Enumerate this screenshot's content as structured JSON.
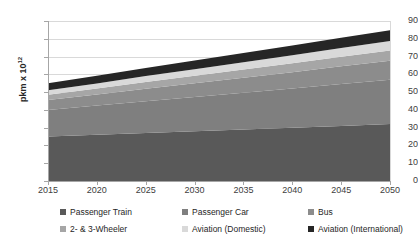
{
  "chart_data": {
    "type": "area",
    "title": "",
    "xlabel": "",
    "ylabel": "pkm  x 10",
    "ylabel_exponent": "12",
    "xlim": [
      2015,
      2050
    ],
    "ylim": [
      0,
      90
    ],
    "ytick_step": 10,
    "xtick_step": 5,
    "grid": true,
    "stacked": true,
    "legend_position": "bottom",
    "x": [
      2015,
      2020,
      2025,
      2030,
      2035,
      2040,
      2045,
      2050
    ],
    "xticks": [
      "2015",
      "2020",
      "2025",
      "2030",
      "2035",
      "2040",
      "2045",
      "2050"
    ],
    "yticks": [
      "0",
      "10",
      "20",
      "30",
      "40",
      "50",
      "60",
      "70",
      "80",
      "90"
    ],
    "series": [
      {
        "name": "Passenger Train",
        "color": "#595959",
        "values": [
          25.0,
          26.0,
          27.0,
          28.0,
          29.0,
          30.0,
          31.0,
          32.0
        ]
      },
      {
        "name": "Passenger Car",
        "color": "#7f7f7f",
        "values": [
          15.0,
          16.4,
          17.9,
          19.3,
          20.7,
          22.1,
          23.6,
          25.0
        ]
      },
      {
        "name": "Bus",
        "color": "#8c8c8c",
        "values": [
          5.5,
          6.2,
          7.0,
          7.7,
          8.4,
          9.1,
          9.9,
          10.6
        ]
      },
      {
        "name": "2- & 3-Wheeler",
        "color": "#a6a6a6",
        "values": [
          3.0,
          3.4,
          3.8,
          4.2,
          4.6,
          5.0,
          5.4,
          5.8
        ]
      },
      {
        "name": "Aviation (Domestic)",
        "color": "#d9d9d9",
        "values": [
          2.5,
          2.9,
          3.3,
          3.7,
          4.1,
          4.5,
          4.9,
          5.3
        ]
      },
      {
        "name": "Aviation (International)",
        "color": "#262626",
        "values": [
          4.0,
          4.3,
          4.6,
          4.9,
          5.2,
          5.5,
          5.8,
          6.1
        ]
      }
    ],
    "totals": [
      55.0,
      59.2,
      63.6,
      67.8,
      72.0,
      76.2,
      80.6,
      84.8
    ]
  },
  "legend": {
    "rows": [
      [
        {
          "label": "Passenger Train",
          "color": "#595959"
        },
        {
          "label": "Passenger Car",
          "color": "#7f7f7f"
        },
        {
          "label": "Bus",
          "color": "#8c8c8c"
        }
      ],
      [
        {
          "label": "2- & 3-Wheeler",
          "color": "#a6a6a6"
        },
        {
          "label": "Aviation (Domestic)",
          "color": "#d9d9d9"
        },
        {
          "label": "Aviation (International)",
          "color": "#262626"
        }
      ]
    ]
  }
}
